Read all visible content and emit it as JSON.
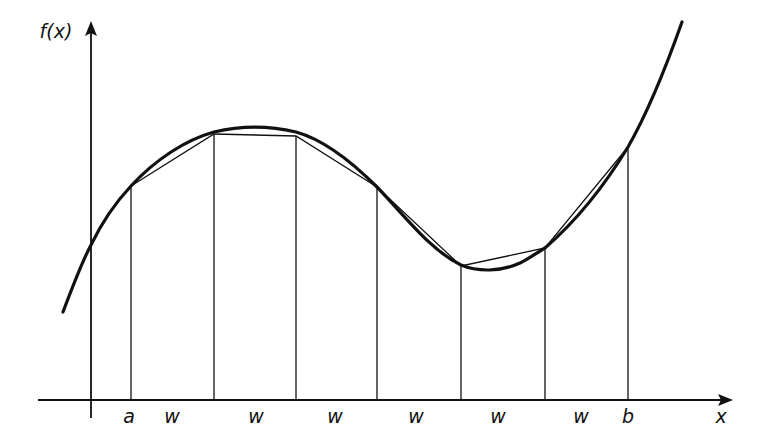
{
  "figure": {
    "y_axis_label": "f(x)",
    "x_axis_label": "x",
    "lower_limit_label": "a",
    "upper_limit_label": "b",
    "interval_width_label": "w",
    "interval_count": 6
  },
  "labels": {
    "fx": "f(x)",
    "x": "x",
    "a": "a",
    "b": "b",
    "w1": "w",
    "w2": "w",
    "w3": "w",
    "w4": "w",
    "w5": "w",
    "w6": "w"
  },
  "colors": {
    "ink": "#111111",
    "background": "#ffffff"
  },
  "geometry": {
    "partition_x_px": [
      131,
      214,
      296,
      377,
      461,
      545,
      628
    ],
    "curve_y_px_at_partitions": [
      186,
      134,
      136,
      187,
      266,
      248,
      147
    ],
    "baseline_y_px": 400,
    "y_axis_x_px": 91
  }
}
